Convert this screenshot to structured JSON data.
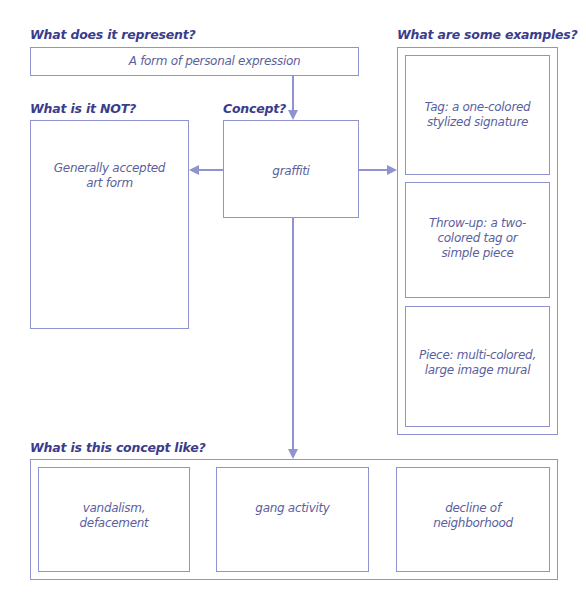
{
  "diagram": {
    "type": "concept-definition-map",
    "colors": {
      "heading": "#3a3c8c",
      "text": "#5c5f9e",
      "border": "#8f93d0"
    },
    "represent": {
      "heading": "What does it represent?",
      "text": "A form of personal expression"
    },
    "not": {
      "heading": "What is it NOT?",
      "text": "Generally accepted art form"
    },
    "concept": {
      "heading": "Concept?",
      "text": "graffiti"
    },
    "examples": {
      "heading": "What are some examples?",
      "items": [
        {
          "text": "Tag: a one-colored stylized signature"
        },
        {
          "text": "Throw-up: a two-colored tag or simple piece"
        },
        {
          "text": "Piece: multi-colored, large image mural"
        }
      ]
    },
    "like": {
      "heading": "What is this concept like?",
      "items": [
        {
          "text": "vandalism, defacement"
        },
        {
          "text": "gang activity"
        },
        {
          "text": "decline of neighborhood"
        }
      ]
    }
  }
}
